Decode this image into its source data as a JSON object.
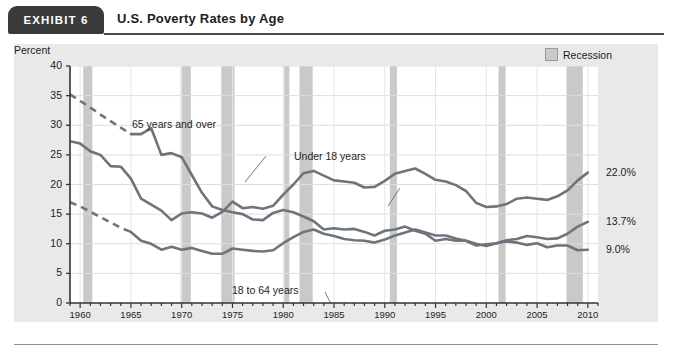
{
  "header": {
    "exhibit_tab": "EXHIBIT  6",
    "title": "U.S. Poverty Rates by Age"
  },
  "legend": {
    "label": "Recession",
    "swatch_color": "#c9c9c9"
  },
  "annotations": {
    "over65": "65 years and over",
    "under18": "Under 18 years",
    "age18to64": "18 to 64 years"
  },
  "end_labels": {
    "under18": "22.0%",
    "age18to64": "13.7%",
    "over65": "9.0%"
  },
  "chart_data": {
    "type": "line",
    "title": "U.S. Poverty Rates by Age",
    "xlabel": "",
    "ylabel": "Percent",
    "xlim": [
      1959,
      2011
    ],
    "ylim": [
      0,
      40
    ],
    "ytick_labels": [
      "0",
      "5",
      "10",
      "15",
      "20",
      "25",
      "30",
      "35",
      "40"
    ],
    "yticks": [
      0,
      5,
      10,
      15,
      20,
      25,
      30,
      35,
      40
    ],
    "xtick_labels": [
      "1960",
      "1965",
      "1970",
      "1975",
      "1980",
      "1985",
      "1990",
      "1995",
      "2000",
      "2005",
      "2010"
    ],
    "xticks": [
      1960,
      1965,
      1970,
      1975,
      1980,
      1985,
      1990,
      1995,
      2000,
      2005,
      2010
    ],
    "minor_xticks_interval": 1,
    "grid": "horizontal",
    "legend_position": "top-right",
    "line_color": "#6e747c",
    "series": [
      {
        "name": "Under 18 years",
        "end_value": 22.0,
        "x": [
          1959,
          1960,
          1961,
          1962,
          1963,
          1964,
          1965,
          1966,
          1967,
          1968,
          1969,
          1970,
          1971,
          1972,
          1973,
          1974,
          1975,
          1976,
          1977,
          1978,
          1979,
          1980,
          1981,
          1982,
          1983,
          1984,
          1985,
          1986,
          1987,
          1988,
          1989,
          1990,
          1991,
          1992,
          1993,
          1994,
          1995,
          1996,
          1997,
          1998,
          1999,
          2000,
          2001,
          2002,
          2003,
          2004,
          2005,
          2006,
          2007,
          2008,
          2009,
          2010
        ],
        "values": [
          27.3,
          26.9,
          25.6,
          25.0,
          23.1,
          23.0,
          21.0,
          17.6,
          16.6,
          15.6,
          14.0,
          15.1,
          15.3,
          15.1,
          14.4,
          15.4,
          17.1,
          16.0,
          16.2,
          15.9,
          16.4,
          18.3,
          20.0,
          21.9,
          22.3,
          21.5,
          20.7,
          20.5,
          20.3,
          19.5,
          19.6,
          20.6,
          21.8,
          22.3,
          22.7,
          21.8,
          20.8,
          20.5,
          19.9,
          18.9,
          16.9,
          16.2,
          16.3,
          16.7,
          17.6,
          17.8,
          17.6,
          17.4,
          18.0,
          19.0,
          20.7,
          22.0
        ]
      },
      {
        "name": "18 to 64 years",
        "end_value": 13.7,
        "dashed_segment": [
          1959,
          1965
        ],
        "x": [
          1959,
          1960,
          1961,
          1962,
          1963,
          1964,
          1965,
          1966,
          1967,
          1968,
          1969,
          1970,
          1971,
          1972,
          1973,
          1974,
          1975,
          1976,
          1977,
          1978,
          1979,
          1980,
          1981,
          1982,
          1983,
          1984,
          1985,
          1986,
          1987,
          1988,
          1989,
          1990,
          1991,
          1992,
          1993,
          1994,
          1995,
          1996,
          1997,
          1998,
          1999,
          2000,
          2001,
          2002,
          2003,
          2004,
          2005,
          2006,
          2007,
          2008,
          2009,
          2010
        ],
        "values": [
          17.0,
          16.3,
          15.4,
          14.5,
          13.6,
          12.7,
          12.0,
          10.5,
          10.0,
          9.0,
          9.5,
          9.0,
          9.3,
          8.8,
          8.3,
          8.3,
          9.2,
          9.0,
          8.8,
          8.7,
          8.9,
          10.1,
          11.1,
          12.0,
          12.4,
          11.7,
          11.3,
          10.8,
          10.6,
          10.5,
          10.2,
          10.7,
          11.4,
          11.9,
          12.4,
          11.9,
          11.4,
          11.4,
          10.9,
          10.5,
          10.0,
          9.6,
          10.1,
          10.6,
          10.8,
          11.3,
          11.1,
          10.8,
          10.9,
          11.7,
          12.9,
          13.7
        ]
      },
      {
        "name": "65 years and over",
        "end_value": 9.0,
        "dashed_segment": [
          1959,
          1965
        ],
        "x": [
          1959,
          1960,
          1961,
          1962,
          1963,
          1964,
          1965,
          1966,
          1967,
          1968,
          1969,
          1970,
          1971,
          1972,
          1973,
          1974,
          1975,
          1976,
          1977,
          1978,
          1979,
          1980,
          1981,
          1982,
          1983,
          1984,
          1985,
          1986,
          1987,
          1988,
          1989,
          1990,
          1991,
          1992,
          1993,
          1994,
          1995,
          1996,
          1997,
          1998,
          1999,
          2000,
          2001,
          2002,
          2003,
          2004,
          2005,
          2006,
          2007,
          2008,
          2009,
          2010
        ],
        "values": [
          35.2,
          34.1,
          33.0,
          31.8,
          30.7,
          29.6,
          28.5,
          28.5,
          29.5,
          25.0,
          25.3,
          24.6,
          21.6,
          18.6,
          16.3,
          15.7,
          15.3,
          15.0,
          14.1,
          14.0,
          15.2,
          15.7,
          15.3,
          14.6,
          13.8,
          12.4,
          12.6,
          12.4,
          12.5,
          12.0,
          11.4,
          12.2,
          12.4,
          12.9,
          12.2,
          11.7,
          10.5,
          10.8,
          10.5,
          10.5,
          9.7,
          9.9,
          10.1,
          10.4,
          10.2,
          9.8,
          10.1,
          9.4,
          9.7,
          9.7,
          8.9,
          9.0
        ]
      }
    ],
    "recession_bands": [
      {
        "start": 1960.3,
        "end": 1961.2
      },
      {
        "start": 1969.9,
        "end": 1970.9
      },
      {
        "start": 1973.9,
        "end": 1975.2
      },
      {
        "start": 1980.1,
        "end": 1980.6
      },
      {
        "start": 1981.6,
        "end": 1982.9
      },
      {
        "start": 1990.5,
        "end": 1991.2
      },
      {
        "start": 2001.2,
        "end": 2001.9
      },
      {
        "start": 2007.9,
        "end": 2009.5
      }
    ],
    "band_color": "#c9c9c9"
  }
}
